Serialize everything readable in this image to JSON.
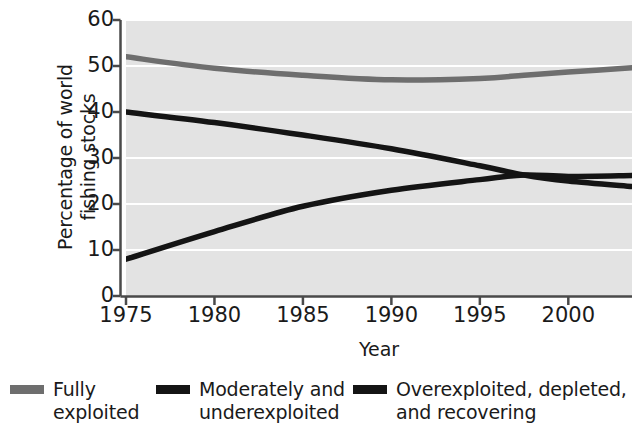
{
  "chart_data": {
    "type": "line",
    "title": "",
    "xlabel": "Year",
    "ylabel": "Percentage of world\nfishing stocks",
    "xlim": [
      1975,
      2003.6
    ],
    "ylim": [
      0,
      60
    ],
    "xticks": [
      1975,
      1980,
      1985,
      1990,
      1995,
      2000
    ],
    "xtick_labels": [
      "1975",
      "1980",
      "1985",
      "1990",
      "1995",
      "2000"
    ],
    "yticks": [
      0,
      10,
      20,
      30,
      40,
      50,
      60
    ],
    "ytick_labels": [
      "0",
      "10",
      "20",
      "30",
      "40",
      "50",
      "60"
    ],
    "grid": "horizontal-white",
    "legend_position": "below",
    "plot_background": "#e3e3e3",
    "x": [
      1975,
      1980,
      1985,
      1990,
      1995,
      1997.5,
      2000,
      2003.6
    ],
    "series": [
      {
        "name": "Fully exploited",
        "label": "Fully\nexploited",
        "color": "#6e6e6e",
        "values": [
          52.0,
          49.5,
          48.0,
          47.0,
          47.3,
          48.0,
          48.7,
          49.6
        ]
      },
      {
        "name": "Moderately and underexploited",
        "label": "Moderately and\nunderexploited",
        "color": "#141414",
        "values": [
          40.0,
          37.7,
          35.0,
          32.0,
          28.3,
          26.3,
          25.0,
          23.8
        ]
      },
      {
        "name": "Overexploited, depleted, and recovering",
        "label": "Overexploited, depleted,\nand recovering",
        "color": "#141414",
        "values": [
          8.0,
          14.0,
          19.5,
          23.0,
          25.3,
          26.3,
          26.0,
          26.2
        ]
      }
    ]
  },
  "axis": {
    "line_color": "#4a4a4a"
  }
}
